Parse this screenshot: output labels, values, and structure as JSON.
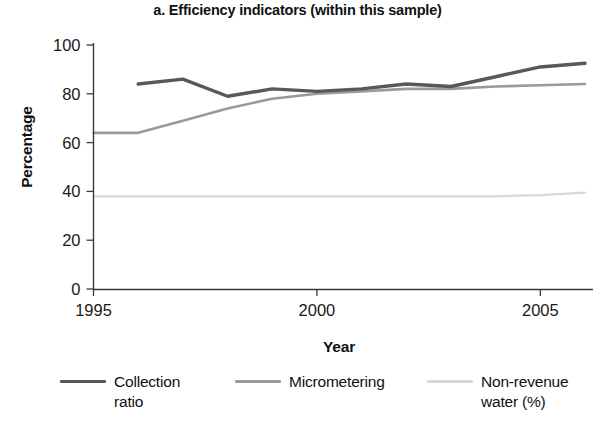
{
  "chart_data": {
    "type": "line",
    "title": "a. Efficiency indicators (within this sample)",
    "xlabel": "Year",
    "ylabel": "Percentage",
    "xlim": [
      1995,
      2006
    ],
    "ylim": [
      0,
      100
    ],
    "xticks": [
      "1995",
      "2000",
      "2005"
    ],
    "xtick_values": [
      1995,
      2000,
      2005
    ],
    "yticks": [
      "0",
      "20",
      "40",
      "60",
      "80",
      "100"
    ],
    "ytick_values": [
      0,
      20,
      40,
      60,
      80,
      100
    ],
    "grid": false,
    "legend_position": "bottom",
    "series": [
      {
        "name": "Collection ratio",
        "legend_label_line1": "Collection",
        "legend_label_line2": "ratio",
        "color": "#585858",
        "width": 3.4,
        "x": [
          1996,
          1997,
          1998,
          1999,
          2000,
          2001,
          2002,
          2003,
          2004,
          2005,
          2006
        ],
        "values": [
          84,
          86,
          79,
          82,
          81,
          82,
          84,
          83,
          87,
          91,
          92.5
        ]
      },
      {
        "name": "Micrometering",
        "legend_label_line1": "Micrometering",
        "legend_label_line2": "",
        "color": "#9a9a9a",
        "width": 2.6,
        "x": [
          1995,
          1996,
          1997,
          1998,
          1999,
          2000,
          2001,
          2002,
          2003,
          2004,
          2005,
          2006
        ],
        "values": [
          64,
          64,
          69,
          74,
          78,
          80,
          81,
          82,
          82,
          83,
          83.5,
          84
        ]
      },
      {
        "name": "Non-revenue water (%)",
        "legend_label_line1": "Non-revenue",
        "legend_label_line2": "water (%)",
        "color": "#d8d8d8",
        "width": 2.2,
        "x": [
          1995,
          1996,
          1997,
          1998,
          1999,
          2000,
          2001,
          2002,
          2003,
          2004,
          2005,
          2006
        ],
        "values": [
          38,
          38,
          38,
          38,
          38,
          38,
          38,
          38,
          38,
          38,
          38.5,
          39.5
        ]
      }
    ]
  }
}
